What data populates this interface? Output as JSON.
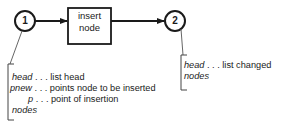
{
  "diagram": {
    "nodes": [
      {
        "id": "1",
        "label": "1"
      },
      {
        "id": "2",
        "label": "2"
      }
    ],
    "process_box": {
      "line1": "insert",
      "line2": "node"
    },
    "input_annotation": {
      "rows": [
        {
          "term": "head",
          "desc": ". . . list head"
        },
        {
          "term": "pnew",
          "desc": ". . . points node to be inserted"
        },
        {
          "term": "p",
          "desc": ". . . point of insertion"
        }
      ],
      "footer": "nodes"
    },
    "output_annotation": {
      "rows": [
        {
          "term": "head",
          "desc": ". . . list changed"
        }
      ],
      "footer": "nodes"
    },
    "colors": {
      "ink": "#1a1a1a",
      "leader": "#666666"
    }
  }
}
